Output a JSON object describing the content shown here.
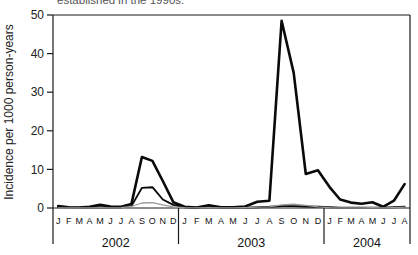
{
  "chart_data": {
    "type": "line",
    "caption_fragment": "established in the 1990s.",
    "ylabel": "Incidence per 1000 person-years",
    "ylim": [
      0,
      50
    ],
    "yticks": [
      0,
      10,
      20,
      30,
      40,
      50
    ],
    "grid": false,
    "legend": "none",
    "axis_color": "#1a1a1a",
    "groups": [
      {
        "year": "2002",
        "months": [
          "J",
          "F",
          "M",
          "A",
          "M",
          "J",
          "J",
          "A",
          "S",
          "O",
          "N",
          "D"
        ]
      },
      {
        "year": "2003",
        "months": [
          "J",
          "F",
          "M",
          "A",
          "M",
          "J",
          "J",
          "A",
          "S",
          "O",
          "N",
          "D"
        ]
      },
      {
        "year": "2004",
        "months": [
          "J",
          "F",
          "M",
          "A",
          "M",
          "J",
          "J",
          "A"
        ]
      }
    ],
    "series": [
      {
        "name": "series-heavy-black",
        "color": "#0a0a0a",
        "stroke_width": 2.6,
        "values": [
          0.5,
          0.2,
          0.1,
          0.3,
          0.8,
          0.4,
          0.3,
          1.0,
          13.2,
          12.2,
          7.0,
          1.5,
          0.3,
          0.1,
          0.7,
          0.2,
          0.2,
          0.4,
          1.6,
          1.9,
          48.5,
          35.0,
          8.8,
          9.8,
          5.5,
          2.2,
          1.4,
          1.1,
          1.5,
          0.3,
          1.9,
          6.2
        ]
      },
      {
        "name": "series-medium-black",
        "color": "#0a0a0a",
        "stroke_width": 1.9,
        "values": [
          0.2,
          0.1,
          0.1,
          0.1,
          0.2,
          0.1,
          0.2,
          0.5,
          5.2,
          5.4,
          2.2,
          0.8,
          0.2,
          0.1,
          0.2,
          0.1,
          0.1,
          0.1,
          0.2,
          0.3,
          0.5,
          0.5,
          0.4,
          0.3,
          0.2,
          0.1,
          0.1,
          0.1,
          0.1,
          0.1,
          0.2,
          0.3
        ]
      },
      {
        "name": "series-gray",
        "color": "#9a9a9a",
        "stroke_width": 1.3,
        "values": [
          0.05,
          0,
          0,
          0.05,
          0.1,
          0.05,
          0.1,
          0.4,
          1.3,
          1.4,
          0.8,
          0.3,
          0.1,
          0.05,
          0.1,
          0.05,
          0.05,
          0.1,
          0.2,
          0.3,
          0.8,
          1.0,
          0.7,
          0.3,
          0.1,
          0.05,
          0.05,
          0.05,
          0.1,
          0.05,
          0.1,
          0.2
        ]
      }
    ]
  }
}
